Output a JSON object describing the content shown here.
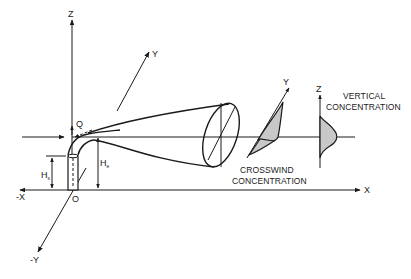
{
  "diagram": {
    "axes": {
      "z_label": "Z",
      "y_label": "Y",
      "x_label": "X",
      "neg_x_label": "-X",
      "neg_y_label": "-Y",
      "origin_label": "O"
    },
    "symbols": {
      "emission_rate": "Q",
      "stack_height_main": "H",
      "stack_height_sub": "s",
      "effective_height_main": "H",
      "effective_height_sub": "e"
    },
    "profiles": {
      "crosswind": {
        "axis_label": "Y",
        "caption_line1": "CROSSWIND",
        "caption_line2": "CONCENTRATION"
      },
      "vertical": {
        "axis_label": "Z",
        "caption_line1": "VERTICAL",
        "caption_line2": "CONCENTRATION"
      }
    },
    "colors": {
      "line": "#1a1a1a",
      "shading": "#c8c8c8",
      "background": "#ffffff"
    }
  }
}
